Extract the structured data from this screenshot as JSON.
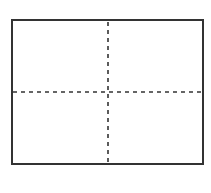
{
  "diagram": {
    "type": "quadrant-grid",
    "canvas": {
      "width": 211,
      "height": 193,
      "background": "#ffffff"
    },
    "frame": {
      "x": 12,
      "y": 20,
      "width": 191,
      "height": 144,
      "stroke": "#333333",
      "stroke_width": 2
    },
    "dividers": {
      "vertical": {
        "x": 108,
        "stroke": "#333333",
        "stroke_width": 1.6,
        "dash": "4 4"
      },
      "horizontal": {
        "y": 92,
        "stroke": "#333333",
        "stroke_width": 1.6,
        "dash": "4 4"
      }
    },
    "quadrants": [
      "top-left",
      "top-right",
      "bottom-left",
      "bottom-right"
    ]
  }
}
